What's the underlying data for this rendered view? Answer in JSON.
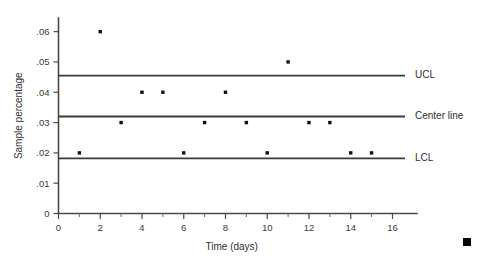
{
  "chart_data": {
    "type": "scatter",
    "title": "",
    "subtitle": "",
    "xlabel": "Time (days)",
    "ylabel": "Sample percentage",
    "xlim": [
      0,
      16.6
    ],
    "ylim": [
      0,
      0.0645
    ],
    "grid": false,
    "legend_position": "right-of-plot",
    "x": [
      1,
      2,
      3,
      4,
      5,
      6,
      7,
      8,
      9,
      10,
      11,
      12,
      13,
      14,
      15
    ],
    "values": [
      0.02,
      0.06,
      0.03,
      0.04,
      0.04,
      0.02,
      0.03,
      0.04,
      0.03,
      0.02,
      0.05,
      0.03,
      0.03,
      0.02,
      0.02
    ],
    "series": [
      {
        "name": "Sample percentage",
        "values": [
          0.02,
          0.06,
          0.03,
          0.04,
          0.04,
          0.02,
          0.03,
          0.04,
          0.03,
          0.02,
          0.05,
          0.03,
          0.03,
          0.02,
          0.02
        ]
      }
    ],
    "x_ticks_major": [
      0,
      2,
      4,
      6,
      8,
      10,
      12,
      14,
      16
    ],
    "x_tick_labels": [
      "0",
      "2",
      "4",
      "6",
      "8",
      "10",
      "12",
      "14",
      "16"
    ],
    "x_ticks_minor": [
      1,
      3,
      5,
      7,
      9,
      11,
      13,
      15
    ],
    "y_ticks_major": [
      0,
      0.01,
      0.02,
      0.03,
      0.04,
      0.05,
      0.06
    ],
    "y_tick_labels": [
      "0",
      ".01",
      ".02",
      ".03",
      ".04",
      ".05",
      ".06"
    ],
    "control_lines": [
      {
        "name": "UCL",
        "label": "UCL",
        "value": 0.0455
      },
      {
        "name": "center",
        "label": "Center line",
        "value": 0.032
      },
      {
        "name": "LCL",
        "label": "LCL",
        "value": 0.0182
      }
    ],
    "colors": {
      "axis": "#4a4a4a",
      "control_line": "#3a3a3a",
      "point": "#111111",
      "text": "#2f2f2f",
      "background": "#ffffff",
      "corner_mark": "#000000"
    }
  },
  "corner_mark": {
    "name": "page-corner-square"
  }
}
